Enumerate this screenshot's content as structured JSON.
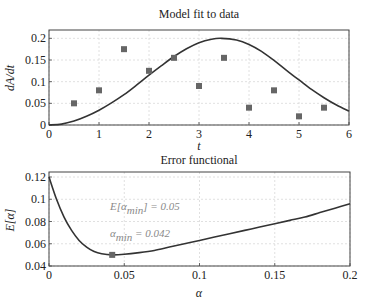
{
  "chart_data": [
    {
      "type": "line+scatter",
      "title": "Model fit to data",
      "xlabel": "t",
      "ylabel": "dA/dt",
      "xlim": [
        0,
        6
      ],
      "ylim": [
        0,
        0.21
      ],
      "xticks": [
        "0",
        "1",
        "2",
        "3",
        "4",
        "5",
        "6"
      ],
      "yticks": [
        "0",
        "0.05",
        "0.1",
        "0.15",
        "0.2"
      ],
      "grid": true,
      "series": [
        {
          "name": "data",
          "kind": "scatter",
          "marker": "square",
          "x": [
            0.5,
            1,
            1.5,
            2,
            2.5,
            3,
            3.5,
            4,
            4.5,
            5,
            5.5
          ],
          "y": [
            0.05,
            0.08,
            0.175,
            0.125,
            0.155,
            0.09,
            0.155,
            0.04,
            0.08,
            0.02,
            0.04
          ]
        },
        {
          "name": "model fit",
          "kind": "line",
          "x": [
            0,
            0.25,
            0.5,
            0.75,
            1,
            1.25,
            1.5,
            1.75,
            2,
            2.25,
            2.5,
            2.75,
            3,
            3.25,
            3.45,
            3.75,
            4,
            4.25,
            4.5,
            4.75,
            5,
            5.25,
            5.5,
            5.75,
            6
          ],
          "y": [
            0,
            0.002,
            0.009,
            0.02,
            0.034,
            0.051,
            0.07,
            0.092,
            0.115,
            0.137,
            0.158,
            0.176,
            0.19,
            0.198,
            0.2,
            0.196,
            0.186,
            0.17,
            0.149,
            0.126,
            0.104,
            0.082,
            0.063,
            0.046,
            0.032
          ]
        }
      ]
    },
    {
      "type": "line",
      "title": "Error functional",
      "xlabel": "α",
      "ylabel": "E[α]",
      "xlim": [
        0,
        0.2
      ],
      "ylim": [
        0.04,
        0.12
      ],
      "xticks": [
        "0",
        "0.05",
        "0.1",
        "0.15",
        "0.2"
      ],
      "yticks": [
        "0.04",
        "0.06",
        "0.08",
        "0.1",
        "0.12"
      ],
      "grid": true,
      "series": [
        {
          "name": "E[α]",
          "kind": "line",
          "x": [
            0,
            0.005,
            0.01,
            0.015,
            0.02,
            0.025,
            0.03,
            0.035,
            0.042,
            0.05,
            0.06,
            0.07,
            0.08,
            0.09,
            0.1,
            0.11,
            0.12,
            0.13,
            0.14,
            0.15,
            0.16,
            0.17,
            0.18,
            0.19,
            0.2
          ],
          "y": [
            0.12,
            0.1,
            0.084,
            0.072,
            0.063,
            0.057,
            0.053,
            0.051,
            0.05,
            0.0505,
            0.052,
            0.054,
            0.057,
            0.06,
            0.063,
            0.066,
            0.069,
            0.072,
            0.075,
            0.078,
            0.081,
            0.084,
            0.088,
            0.092,
            0.096
          ]
        },
        {
          "name": "minimum",
          "kind": "scatter",
          "marker": "square",
          "x": [
            0.042
          ],
          "y": [
            0.05
          ]
        }
      ],
      "annotations": [
        {
          "text": "E[α_min] = 0.05",
          "x": 0.09,
          "y": 0.098
        },
        {
          "text": "α_min = 0.042",
          "x": 0.09,
          "y": 0.075
        }
      ]
    }
  ],
  "labels": {
    "top_title": "Model fit to data",
    "top_xlabel": "t",
    "top_ylabel": "dA/dt",
    "bottom_title": "Error functional",
    "bottom_xlabel": "α",
    "bottom_ylabel": "E[α]",
    "anno1_pre": "E[α",
    "anno1_sub": "min",
    "anno1_post": "] = 0.05",
    "anno2_pre": "α",
    "anno2_sub": "min",
    "anno2_post": " = 0.042"
  },
  "colors": {
    "curve": "#333333",
    "marker": "#666666",
    "grid": "#d8d8d8",
    "axis": "#444444",
    "annotation": "#8a8a8a"
  }
}
